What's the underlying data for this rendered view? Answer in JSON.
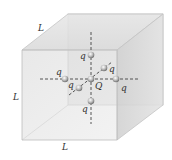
{
  "diagram": {
    "labels": {
      "edge_top": "L",
      "edge_left": "L",
      "edge_bottom": "L",
      "center_charge": "Q",
      "charge_up": "q",
      "charge_down": "q",
      "charge_left": "q",
      "charge_right": "q",
      "charge_front": "q",
      "charge_back": "q"
    },
    "colors": {
      "cube_face": "#d8d8d8",
      "cube_edge": "#bdbdbd",
      "axis_line": "#444444",
      "charge": "#c9c9c9"
    }
  }
}
